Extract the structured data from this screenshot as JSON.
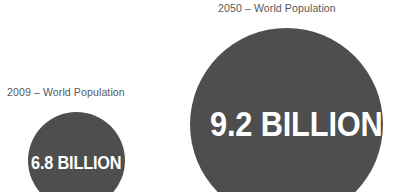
{
  "page": {
    "background_color": "#ffffff",
    "bubble_color": "#4e4e4e",
    "caption_color": "#58595b",
    "value_color": "#ffffff"
  },
  "chart_data": {
    "type": "bubble",
    "title": "",
    "subtitle": "",
    "xlabel": "",
    "ylabel": "",
    "grid": false,
    "legend": "none",
    "units": "billion people",
    "categories": [
      "2009",
      "2050"
    ],
    "values": [
      6.8,
      9.2
    ],
    "series": [
      {
        "name": "World Population",
        "values": [
          6.8,
          9.2
        ]
      }
    ],
    "points": [
      {
        "year": "2009",
        "caption": "2009 – World Population",
        "value": 6.8,
        "value_label": "6.8 BILLION",
        "bubble_diameter_px": 97,
        "color": "#4e4e4e"
      },
      {
        "year": "2050",
        "caption": "2050 – World Population",
        "value": 9.2,
        "value_label": "9.2 BILLION",
        "bubble_diameter_px": 193,
        "color": "#4e4e4e"
      }
    ],
    "annotations": [
      "2009 – World Population",
      "6.8 BILLION",
      "2050 – World Population",
      "9.2 BILLION"
    ]
  },
  "bubbles": {
    "population_2009": {
      "caption": "2009 – World Population",
      "value_label": "6.8 BILLION"
    },
    "population_2050": {
      "caption": "2050 – World Population",
      "value_label": "9.2 BILLION"
    }
  }
}
